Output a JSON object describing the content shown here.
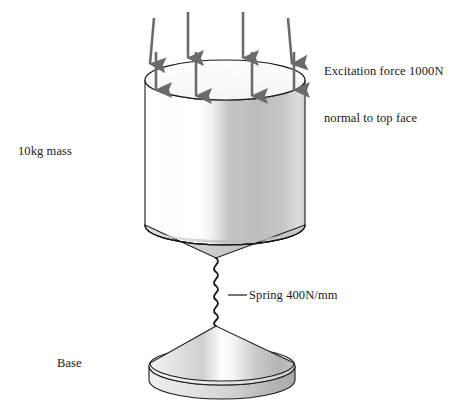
{
  "figure": {
    "background_color": "#ffffff",
    "stroke_color": "#1a1a1a",
    "arrow_color": "#6b6b6b",
    "body_fill_light": "#ffffff",
    "body_fill_mid": "#c9c9c9",
    "body_fill_dark": "#a8a8a8"
  },
  "labels": {
    "excitation": "Excitation force 1000N\nnormal to top face",
    "excitation_line1": "Excitation force 1000N",
    "excitation_line2": "normal to top face",
    "mass": "10kg mass",
    "spring": "Spring 400N/mm",
    "base": "Base"
  },
  "components": {
    "mass_cylinder": {
      "name": "10kg mass",
      "shape": "cylinder",
      "top_center_x": 225,
      "top_center_y": 80,
      "radius_x": 80,
      "radius_y": 20,
      "height": 145
    },
    "mass_cone": {
      "name": "mass taper cone",
      "shape": "cone",
      "apex_x": 216,
      "apex_y": 258
    },
    "spring": {
      "name": "Spring 400N/mm",
      "shape": "coil",
      "stiffness": "400N/mm",
      "coils": 8,
      "top_y": 258,
      "bottom_y": 326,
      "amplitude": 6
    },
    "base_cone": {
      "name": "Base",
      "shape": "cone",
      "apex_x": 216,
      "apex_y": 326
    },
    "base_disc": {
      "name": "base disc",
      "shape": "disc",
      "center_x": 222,
      "center_y": 366,
      "radius_x": 73,
      "radius_y": 19,
      "thickness": 14
    }
  },
  "force_arrows": {
    "name": "excitation force arrows",
    "count": 8,
    "direction": "down",
    "magnitude": "1000N",
    "back_row": [
      {
        "x": 152,
        "y_start": 18,
        "y_end": 72,
        "slanted": true
      },
      {
        "x": 188,
        "y_start": 12,
        "y_end": 66,
        "slanted": false
      },
      {
        "x": 243,
        "y_start": 12,
        "y_end": 66,
        "slanted": false
      },
      {
        "x": 290,
        "y_start": 18,
        "y_end": 72,
        "slanted": true
      }
    ],
    "front_row": [
      {
        "x": 156,
        "y_start": 48,
        "y_end": 96
      },
      {
        "x": 194,
        "y_start": 48,
        "y_end": 102
      },
      {
        "x": 251,
        "y_start": 48,
        "y_end": 102
      },
      {
        "x": 292,
        "y_start": 48,
        "y_end": 96
      }
    ]
  },
  "leader_line": {
    "name": "spring leader line",
    "x1": 228,
    "y1": 295,
    "x2": 247,
    "y2": 295
  }
}
